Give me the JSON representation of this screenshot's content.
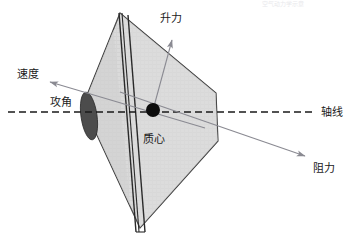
{
  "figure": {
    "title_watermark": "空气动力学示意",
    "background_color": "#ffffff",
    "canopy_fill": "#d9d9d9",
    "canopy_stroke": "#3a3a3a",
    "nose_ellipse_fill": "#4a4a4a",
    "center_dot_fill": "#0d0d0d",
    "axis_color": "#1a1a1a",
    "arrow_color": "#808088",
    "label_color": "#1a1a1a"
  },
  "labels": {
    "lift": "升力",
    "velocity": "速度",
    "angle_of_attack": "攻角",
    "center_of_mass": "质心",
    "axis_line": "轴线",
    "drag": "阻力"
  },
  "geometry": {
    "canopy_points": "120,13 83,105 140,228 218,141 216,93",
    "apex": {
      "x": 120,
      "y": 13
    },
    "bottom_vertex": {
      "x": 140,
      "y": 228
    },
    "left_vertex": {
      "x": 83,
      "y": 105
    },
    "right_upper_vertex": {
      "x": 216,
      "y": 93
    },
    "right_lower_vertex": {
      "x": 218,
      "y": 141
    },
    "nose_ellipse": {
      "cx": 89,
      "cy": 116,
      "rx": 8,
      "ry": 24,
      "rotate": -8
    },
    "center_dot": {
      "cx": 153,
      "cy": 110,
      "r": 7
    },
    "axis_y": 112,
    "axis_x_start": 8,
    "axis_x_end": 316
  },
  "vectors": {
    "lift": {
      "from_x": 153,
      "from_y": 110,
      "to_x": 173,
      "to_y": 38
    },
    "velocity": {
      "from_x": 205,
      "from_y": 128,
      "to_x": 48,
      "to_y": 82
    },
    "drag": {
      "from_x": 120,
      "from_y": 92,
      "to_x": 307,
      "to_y": 156
    }
  }
}
